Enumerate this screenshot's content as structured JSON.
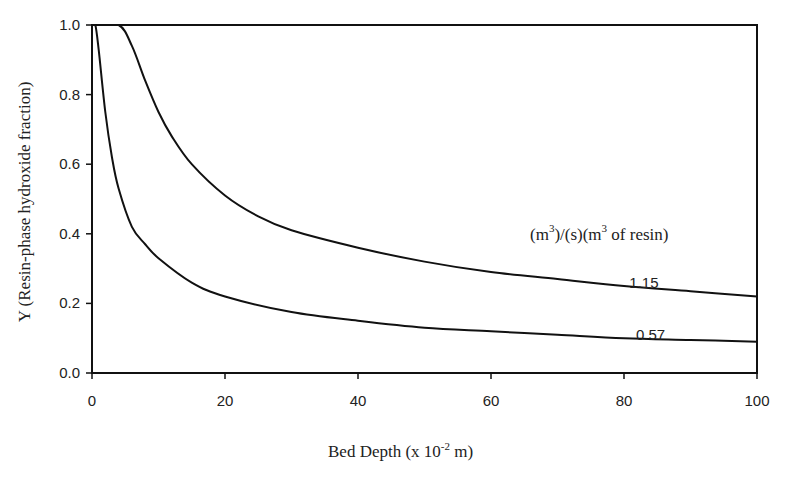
{
  "chart_data": {
    "type": "line",
    "title": "",
    "xlabel": "Bed Depth (x 10^-2 m)",
    "xlabel_parts": {
      "main": "Bed Depth (x 10",
      "sup": "-2",
      "tail": " m)"
    },
    "ylabel": "Y (Resin-phase hydroxide fraction)",
    "xlim": [
      0,
      100
    ],
    "ylim": [
      0.0,
      1.0
    ],
    "xticks": [
      "0",
      "20",
      "40",
      "60",
      "80",
      "100"
    ],
    "yticks": [
      "0.0",
      "0.2",
      "0.4",
      "0.6",
      "0.8",
      "1.0"
    ],
    "grid": false,
    "legend_title": "(m^3)/(s)(m^3 of resin)",
    "legend_parts": {
      "a": "(m",
      "sup1": "3",
      "b": ")/(s)(m",
      "sup2": "3",
      "c": " of resin)"
    },
    "series": [
      {
        "name": "1.15",
        "x": [
          0,
          4,
          6,
          8,
          10,
          12,
          15,
          20,
          25,
          30,
          40,
          50,
          60,
          70,
          80,
          90,
          100
        ],
        "values": [
          1.0,
          1.0,
          0.94,
          0.84,
          0.75,
          0.68,
          0.6,
          0.51,
          0.45,
          0.41,
          0.36,
          0.32,
          0.29,
          0.27,
          0.25,
          0.235,
          0.22
        ]
      },
      {
        "name": "0.57",
        "x": [
          0,
          0.5,
          1,
          2,
          3,
          4,
          6,
          8,
          10,
          15,
          20,
          30,
          40,
          50,
          60,
          70,
          80,
          90,
          100
        ],
        "values": [
          1.0,
          1.0,
          0.93,
          0.75,
          0.62,
          0.53,
          0.42,
          0.37,
          0.33,
          0.26,
          0.22,
          0.175,
          0.15,
          0.13,
          0.12,
          0.11,
          0.1,
          0.095,
          0.09
        ]
      }
    ],
    "annotations": [
      {
        "text": "1.15",
        "x": 83,
        "y": 0.25
      },
      {
        "text": "0.57",
        "x": 84,
        "y": 0.1
      }
    ]
  }
}
